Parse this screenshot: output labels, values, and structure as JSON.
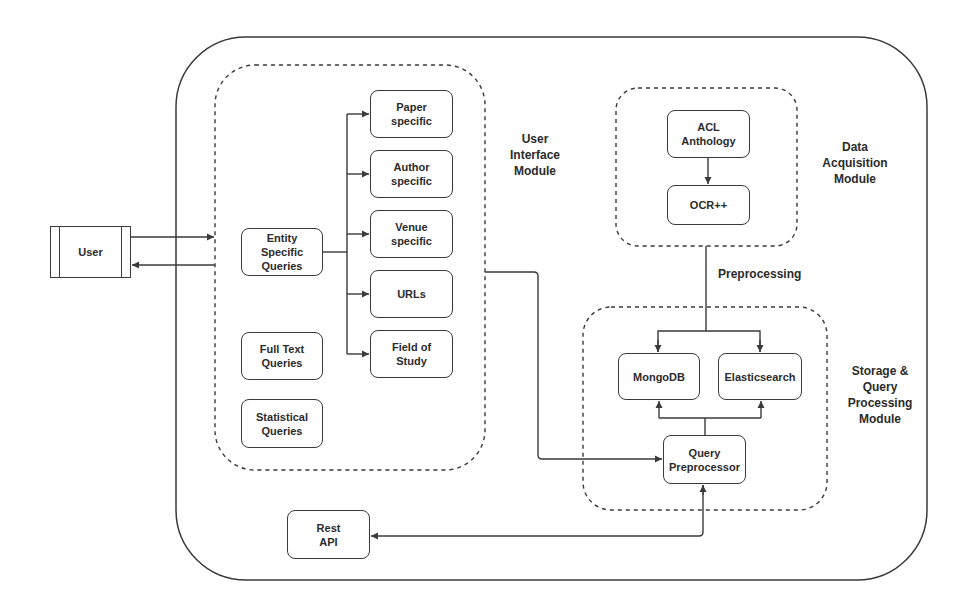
{
  "diagram": {
    "type": "system-architecture",
    "colors": {
      "stroke": "#3a3a3a",
      "text": "#2b2b2b",
      "background": "#ffffff"
    },
    "nodes": {
      "user": {
        "label": "User"
      },
      "entity_specific_queries": {
        "label": "Entity\nSpecific\nQueries"
      },
      "paper_specific": {
        "label": "Paper\nspecific"
      },
      "author_specific": {
        "label": "Author\nspecific"
      },
      "venue_specific": {
        "label": "Venue\nspecific"
      },
      "urls": {
        "label": "URLs"
      },
      "field_of_study": {
        "label": "Field of\nStudy"
      },
      "full_text_queries": {
        "label": "Full Text\nQueries"
      },
      "statistical_queries": {
        "label": "Statistical\nQueries"
      },
      "acl_anthology": {
        "label": "ACL\nAnthology"
      },
      "ocr_pp": {
        "label": "OCR++"
      },
      "mongodb": {
        "label": "MongoDB"
      },
      "elasticsearch": {
        "label": "Elasticsearch"
      },
      "query_preprocessor": {
        "label": "Query\nPreprocessor"
      },
      "rest_api": {
        "label": "Rest\nAPI"
      }
    },
    "groups": {
      "user_interface_module": {
        "label": "User\nInterface\nModule"
      },
      "data_acquisition_module": {
        "label": "Data\nAcquisition\nModule"
      },
      "storage_query_module": {
        "label": "Storage &\nQuery\nProcessing\nModule"
      }
    },
    "edge_labels": {
      "preprocessing": "Preprocessing"
    },
    "edges": [
      {
        "from": "user",
        "to": "user_interface_module"
      },
      {
        "from": "user_interface_module",
        "to": "user"
      },
      {
        "from": "entity_specific_queries",
        "to": "paper_specific"
      },
      {
        "from": "entity_specific_queries",
        "to": "author_specific"
      },
      {
        "from": "entity_specific_queries",
        "to": "venue_specific"
      },
      {
        "from": "entity_specific_queries",
        "to": "urls"
      },
      {
        "from": "entity_specific_queries",
        "to": "field_of_study"
      },
      {
        "from": "acl_anthology",
        "to": "ocr_pp"
      },
      {
        "from": "data_acquisition_module",
        "to": "mongodb",
        "label": "Preprocessing"
      },
      {
        "from": "data_acquisition_module",
        "to": "elasticsearch",
        "label": "Preprocessing"
      },
      {
        "from": "query_preprocessor",
        "to": "mongodb"
      },
      {
        "from": "query_preprocessor",
        "to": "elasticsearch"
      },
      {
        "from": "user_interface_module",
        "to": "query_preprocessor"
      },
      {
        "from": "rest_api",
        "to": "query_preprocessor"
      },
      {
        "from": "query_preprocessor",
        "to": "rest_api"
      }
    ]
  }
}
